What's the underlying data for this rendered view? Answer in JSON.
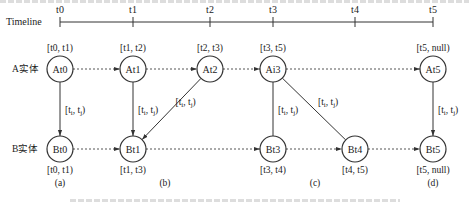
{
  "timeline": {
    "label": "Timeline",
    "ticks": [
      {
        "label": "t0",
        "x": 60
      },
      {
        "label": "t1",
        "x": 133
      },
      {
        "label": "t2",
        "x": 210
      },
      {
        "label": "t3",
        "x": 273
      },
      {
        "label": "t4",
        "x": 355
      },
      {
        "label": "t5",
        "x": 433
      }
    ]
  },
  "rows": {
    "a_label": "A实体",
    "b_label": "B实体"
  },
  "nodes_a": [
    {
      "id": "At0",
      "label": "At0",
      "x": 60,
      "interval": "[t0, t1)"
    },
    {
      "id": "At1",
      "label": "At1",
      "x": 133,
      "interval": "[t1, t2)"
    },
    {
      "id": "At2",
      "label": "At2",
      "x": 210,
      "interval": "[t2, t3)"
    },
    {
      "id": "Ai3",
      "label": "Ai3",
      "x": 273,
      "interval": "[t3, t5)"
    },
    {
      "id": "At5",
      "label": "At5",
      "x": 433,
      "interval": "[t5, null)"
    }
  ],
  "nodes_b": [
    {
      "id": "Bt0",
      "label": "Bt0",
      "x": 60,
      "interval": "[t0, t1)"
    },
    {
      "id": "Bt1",
      "label": "Bt1",
      "x": 133,
      "interval": "[t1, t3)"
    },
    {
      "id": "Bt3",
      "label": "Bt3",
      "x": 273,
      "interval": "[t3, t4)"
    },
    {
      "id": "Bt4",
      "label": "Bt4",
      "x": 355,
      "interval": "[t4, t5)"
    },
    {
      "id": "Bt5",
      "label": "Bt5",
      "x": 433,
      "interval": "[t5, null)"
    }
  ],
  "cross_edges": [
    {
      "from": "At0",
      "to": "Bt0",
      "label": "[ti, tj)"
    },
    {
      "from": "At1",
      "to": "Bt1",
      "label": "[ti, tj)"
    },
    {
      "from": "At2",
      "to": "Bt1",
      "label": "[ti, tj)"
    },
    {
      "from": "Ai3",
      "to": "Bt3",
      "label": "[ti, tj)"
    },
    {
      "from": "Ai3",
      "to": "Bt4",
      "label": "[ti, tj)"
    },
    {
      "from": "At5",
      "to": "Bt5",
      "label": "[ti, tj)"
    }
  ],
  "panels": [
    {
      "label": "(a)",
      "x": 60
    },
    {
      "label": "(b)",
      "x": 165
    },
    {
      "label": "(c)",
      "x": 315
    },
    {
      "label": "(d)",
      "x": 433
    }
  ],
  "colors": {
    "stroke": "#333333",
    "text": "#222222",
    "background": "#ffffff",
    "cut_text": "#d8d8d8"
  }
}
